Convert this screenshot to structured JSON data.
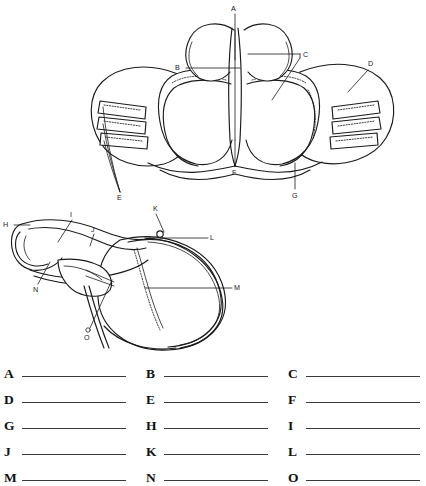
{
  "document": {
    "kind": "anatomy-labeling-worksheet",
    "subject": "English saddle"
  },
  "figures": [
    {
      "id": "figure-top",
      "name": "saddle-front-view",
      "labels": [
        {
          "letter": "A",
          "x": 234,
          "y": 8
        },
        {
          "letter": "B",
          "x": 177,
          "y": 68
        },
        {
          "letter": "C",
          "x": 305,
          "y": 58
        },
        {
          "letter": "D",
          "x": 371,
          "y": 66
        },
        {
          "letter": "E",
          "x": 121,
          "y": 198
        },
        {
          "letter": "F",
          "x": 235,
          "y": 172
        },
        {
          "letter": "G",
          "x": 295,
          "y": 196
        }
      ]
    },
    {
      "id": "figure-side",
      "name": "saddle-side-view",
      "labels": [
        {
          "letter": "H",
          "x": 5,
          "y": 225
        },
        {
          "letter": "I",
          "x": 72,
          "y": 216
        },
        {
          "letter": "J",
          "x": 93,
          "y": 231
        },
        {
          "letter": "K",
          "x": 157,
          "y": 209
        },
        {
          "letter": "L",
          "x": 212,
          "y": 237
        },
        {
          "letter": "M",
          "x": 238,
          "y": 289
        },
        {
          "letter": "N",
          "x": 35,
          "y": 289
        },
        {
          "letter": "O",
          "x": 88,
          "y": 333
        }
      ]
    }
  ],
  "answer_grid": {
    "rows": [
      [
        {
          "letter": "A",
          "value": ""
        },
        {
          "letter": "B",
          "value": ""
        },
        {
          "letter": "C",
          "value": ""
        }
      ],
      [
        {
          "letter": "D",
          "value": ""
        },
        {
          "letter": "E",
          "value": ""
        },
        {
          "letter": "F",
          "value": ""
        }
      ],
      [
        {
          "letter": "G",
          "value": ""
        },
        {
          "letter": "H",
          "value": ""
        },
        {
          "letter": "I",
          "value": ""
        }
      ],
      [
        {
          "letter": "J",
          "value": ""
        },
        {
          "letter": "K",
          "value": ""
        },
        {
          "letter": "L",
          "value": ""
        }
      ],
      [
        {
          "letter": "M",
          "value": ""
        },
        {
          "letter": "N",
          "value": ""
        },
        {
          "letter": "O",
          "value": ""
        }
      ]
    ]
  },
  "colors": {
    "ink": "#1a1a1a",
    "rule": "#3a3a3a",
    "paper": "#ffffff"
  }
}
